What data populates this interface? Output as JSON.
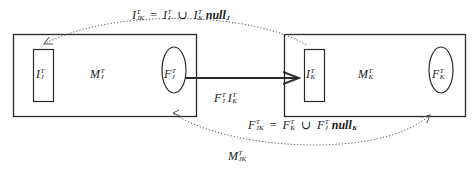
{
  "diagram": {
    "left_box": {
      "label": {
        "base": "M",
        "sup": "T",
        "sub": "J"
      },
      "inner_rect": {
        "base": "I",
        "sup": "T",
        "sub": "J"
      },
      "ellipse": {
        "base": "F",
        "sup": "T",
        "sub": "J"
      }
    },
    "right_box": {
      "label": {
        "base": "M",
        "sup": "T",
        "sub": "K"
      },
      "inner_rect": {
        "base": "I",
        "sup": "T",
        "sub": "K"
      },
      "ellipse": {
        "base": "F",
        "sup": "T",
        "sub": "K"
      }
    },
    "arrow_label": {
      "a": {
        "base": "F",
        "sup": "T",
        "sub": "J"
      },
      "b": {
        "base": "I",
        "sup": "T",
        "sub": "K"
      }
    },
    "top_equation": {
      "lhs": {
        "base": "I",
        "sup": "T",
        "sub": "JK"
      },
      "eq": "=",
      "t1": {
        "base": "I",
        "sup": "T",
        "sub": "J"
      },
      "union": "∪",
      "t2": {
        "base": "I",
        "sup": "T",
        "sub": "K"
      },
      "null": "null",
      "null_sub": "J"
    },
    "bottom_equation": {
      "lhs": {
        "base": "F",
        "sup": "T",
        "sub": "JK"
      },
      "eq": "=",
      "t1": {
        "base": "F",
        "sup": "T",
        "sub": "K"
      },
      "union": "∪",
      "t2": {
        "base": "F",
        "sup": "T",
        "sub": "J"
      },
      "null": "null",
      "null_sub": "K"
    },
    "merged_label": {
      "base": "M",
      "sup": "T",
      "sub": "JK"
    },
    "colors": {
      "stroke": "#2a2a2a",
      "dotted": "#555555",
      "background": "#ffffff"
    }
  }
}
